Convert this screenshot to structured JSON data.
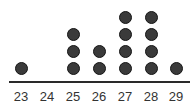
{
  "chart_data": {
    "type": "dot",
    "title": "",
    "xlabel": "",
    "ylabel": "",
    "categories": [
      "23",
      "24",
      "25",
      "26",
      "27",
      "28",
      "29"
    ],
    "values": [
      1,
      0,
      3,
      2,
      4,
      4,
      1
    ],
    "grid": false,
    "legend": null,
    "colors": {
      "dot": "#3a3a3a",
      "axis": "#2a2a2a",
      "text": "#333333"
    }
  }
}
